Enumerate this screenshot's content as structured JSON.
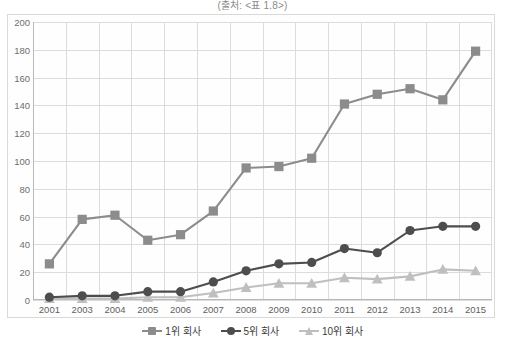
{
  "chart_data": {
    "type": "line",
    "title": "(출처: <표 1.8>)",
    "xlabel": "",
    "ylabel": "",
    "ylim": [
      0,
      200
    ],
    "ytick_step": 20,
    "yticks": [
      0,
      20,
      40,
      60,
      80,
      100,
      120,
      140,
      160,
      180,
      200
    ],
    "grid": true,
    "legend_position": "bottom",
    "categories": [
      "2001",
      "2003",
      "2004",
      "2005",
      "2006",
      "2007",
      "2008",
      "2009",
      "2010",
      "2011",
      "2012",
      "2013",
      "2014",
      "2015"
    ],
    "series": [
      {
        "name": "1위 회사",
        "color": "#8c8c8c",
        "marker": "square",
        "values": [
          26,
          58,
          61,
          43,
          47,
          64,
          95,
          96,
          102,
          141,
          148,
          152,
          144,
          179
        ]
      },
      {
        "name": "5위 회사",
        "color": "#4d4d4d",
        "marker": "circle",
        "values": [
          2,
          3,
          3,
          6,
          6,
          13,
          21,
          26,
          27,
          37,
          34,
          50,
          53,
          53
        ]
      },
      {
        "name": "10위 회사",
        "color": "#bfbfbf",
        "marker": "triangle",
        "values": [
          1,
          1,
          1,
          2,
          2,
          5,
          9,
          12,
          12,
          16,
          15,
          17,
          22,
          21
        ]
      }
    ]
  },
  "legend": {
    "items": [
      {
        "label": "1위 회사"
      },
      {
        "label": "5위 회사"
      },
      {
        "label": "10위 회사"
      }
    ]
  }
}
